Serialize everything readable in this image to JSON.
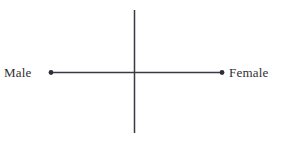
{
  "diagram": {
    "type": "bipolar-axis-cross",
    "background_color": "#ffffff",
    "stroke_color": "#3a3a42",
    "canvas": {
      "width": 281,
      "height": 141
    },
    "vertical_axis": {
      "name": "vertical-axis",
      "x": 134.5,
      "y_top": 10,
      "y_bottom": 133,
      "stroke_width": 1.5,
      "has_endpoint_markers": false
    },
    "horizontal_axis": {
      "name": "horizontal-axis",
      "y": 72.5,
      "x_left": 51,
      "x_right": 222,
      "stroke_width": 1.5,
      "has_endpoint_markers": true,
      "marker_radius": 2.4
    },
    "labels": {
      "left": "Male",
      "right": "Female"
    },
    "markers": {
      "left_point": {
        "cx": 51,
        "cy": 72.5
      },
      "right_point": {
        "cx": 222,
        "cy": 72.5
      }
    }
  }
}
